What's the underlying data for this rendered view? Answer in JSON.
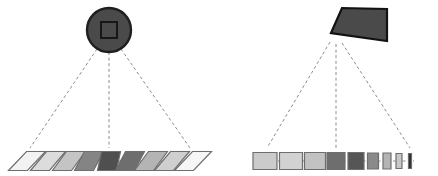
{
  "figure": {
    "width": 438,
    "height": 176,
    "background_color": "#ffffff",
    "panel_count": 2
  },
  "colors": {
    "background": "#ffffff",
    "camera_fill": "#4a4a4a",
    "camera_stroke": "#1a1a1a",
    "ray_stroke": "#8c8c8c",
    "patch_stroke": "#6e6e6e",
    "connector_stroke": "#8c8c8c",
    "shade_lightest": "#f2f2f2",
    "shade_light": "#dcdcdc",
    "shade_mid_light": "#bdbdbd",
    "shade_mid": "#9a9a9a",
    "shade_mid_dark": "#6e6e6e",
    "shade_dark": "#4f4f4f",
    "shade_darkest": "#3a3a3a"
  },
  "panels": [
    {
      "id": "left-panel",
      "name": "orthographic-camera-panel",
      "camera": {
        "name": "circular-camera",
        "shape": "circle",
        "center_x": 109,
        "center_y": 30,
        "radius": 22,
        "fill": "#4a4a4a",
        "stroke": "#1f1f1f",
        "stroke_width": 2.4,
        "sensor": {
          "name": "square-sensor",
          "shape": "square",
          "x": 101,
          "y": 22,
          "width": 16,
          "height": 16,
          "fill": "#4a4a4a",
          "stroke": "#171717",
          "stroke_width": 2
        }
      },
      "rays": [
        {
          "name": "ray-left",
          "x1": 97,
          "y1": 49,
          "x2": 30,
          "y2": 148
        },
        {
          "name": "ray-center",
          "x1": 109,
          "y1": 52,
          "x2": 109,
          "y2": 148
        },
        {
          "name": "ray-right",
          "x1": 121,
          "y1": 49,
          "x2": 190,
          "y2": 148
        }
      ],
      "baseline": {
        "name": "patch-baseline",
        "x1": 24,
        "y1": 161,
        "x2": 196,
        "y2": 161
      },
      "patches": [
        {
          "name": "patch-1",
          "cx": 27,
          "cy": 161,
          "width": 19,
          "height": 19,
          "skew": 9,
          "fill": "#f2f2f2"
        },
        {
          "name": "patch-2",
          "cx": 48,
          "cy": 161,
          "width": 19,
          "height": 19,
          "skew": 8,
          "fill": "#dcdcdc"
        },
        {
          "name": "patch-3",
          "cx": 69,
          "cy": 161,
          "width": 19,
          "height": 19,
          "skew": 7,
          "fill": "#c4c4c4"
        },
        {
          "name": "patch-4",
          "cx": 89,
          "cy": 161,
          "width": 19,
          "height": 19,
          "skew": 5,
          "fill": "#848484"
        },
        {
          "name": "patch-5",
          "cx": 109,
          "cy": 161,
          "width": 19,
          "height": 19,
          "skew": 2,
          "fill": "#4f4f4f"
        },
        {
          "name": "patch-6",
          "cx": 130,
          "cy": 161,
          "width": 19,
          "height": 19,
          "skew": 5,
          "fill": "#6e6e6e"
        },
        {
          "name": "patch-7",
          "cx": 151,
          "cy": 161,
          "width": 19,
          "height": 19,
          "skew": 7,
          "fill": "#b4b4b4"
        },
        {
          "name": "patch-8",
          "cx": 172,
          "cy": 161,
          "width": 19,
          "height": 19,
          "skew": 8,
          "fill": "#cfcfcf"
        },
        {
          "name": "patch-9",
          "cx": 193,
          "cy": 161,
          "width": 19,
          "height": 19,
          "skew": 9,
          "fill": "#f6f6f6"
        }
      ]
    },
    {
      "id": "right-panel",
      "name": "perspective-camera-panel",
      "camera": {
        "name": "frustum-camera",
        "shape": "quadrilateral",
        "points": "331,33 341,8 386,8 386,41 331,41",
        "polygon": "331,33 342,8 387,9 387,41",
        "fill": "#4a4a4a",
        "stroke": "#121212",
        "stroke_width": 2.2,
        "apex_x": 331,
        "apex_y": 40
      },
      "rays": [
        {
          "name": "ray-left",
          "x1": 330,
          "y1": 42,
          "x2": 267,
          "y2": 148
        },
        {
          "name": "ray-center",
          "x1": 336,
          "y1": 44,
          "x2": 336,
          "y2": 148
        },
        {
          "name": "ray-right",
          "x1": 342,
          "y1": 43,
          "x2": 410,
          "y2": 148
        }
      ],
      "baseline": {
        "name": "patch-baseline",
        "x1": 258,
        "y1": 161,
        "x2": 414,
        "y2": 161
      },
      "patches": [
        {
          "name": "patch-1",
          "cx": 265,
          "cy": 161,
          "width": 24,
          "height": 17,
          "fill": "#cbcbcb"
        },
        {
          "name": "patch-2",
          "cx": 291,
          "cy": 161,
          "width": 23,
          "height": 17,
          "fill": "#d2d2d2"
        },
        {
          "name": "patch-3",
          "cx": 315,
          "cy": 161,
          "width": 21,
          "height": 17,
          "fill": "#c2c2c2"
        },
        {
          "name": "patch-4",
          "cx": 336,
          "cy": 161,
          "width": 18,
          "height": 17,
          "fill": "#6e6e6e"
        },
        {
          "name": "patch-5",
          "cx": 356,
          "cy": 161,
          "width": 16,
          "height": 17,
          "fill": "#565656"
        },
        {
          "name": "patch-6",
          "cx": 373,
          "cy": 161,
          "width": 11,
          "height": 16,
          "fill": "#8a8a8a"
        },
        {
          "name": "patch-7",
          "cx": 387,
          "cy": 161,
          "width": 8,
          "height": 16,
          "fill": "#b4b4b4"
        },
        {
          "name": "patch-8",
          "cx": 399,
          "cy": 161,
          "width": 6,
          "height": 15,
          "fill": "#c8c8c8"
        },
        {
          "name": "patch-9",
          "cx": 410,
          "cy": 161,
          "width": 3,
          "height": 15,
          "fill": "#2e2e2e"
        }
      ]
    }
  ]
}
